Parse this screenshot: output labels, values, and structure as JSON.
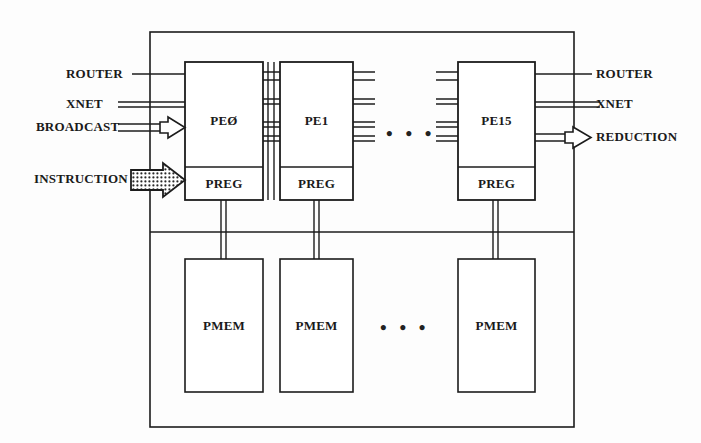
{
  "diagram": {
    "ink_color": "#1c1c1c",
    "background_color": "#fdfdfd",
    "inputs_left": [
      {
        "name": "router-in",
        "label": "ROUTER",
        "style": "single-line",
        "arrow": false
      },
      {
        "name": "xnet-in",
        "label": "XNET",
        "style": "double-line",
        "arrow": false
      },
      {
        "name": "broadcast-in",
        "label": "BROADCAST",
        "style": "double-line",
        "arrow": true
      },
      {
        "name": "instruction-in",
        "label": "INSTRUCTION",
        "style": "hatched-arrow",
        "arrow": true
      }
    ],
    "outputs_right": [
      {
        "name": "router-out",
        "label": "ROUTER",
        "style": "single-line",
        "arrow": false
      },
      {
        "name": "xnet-out",
        "label": "XNET",
        "style": "double-line",
        "arrow": false
      },
      {
        "name": "reduction-out",
        "label": "REDUCTION",
        "style": "double-line",
        "arrow": true
      }
    ],
    "pe_units": [
      {
        "name": "pe-0",
        "label": "PEØ",
        "reg_label": "PREG",
        "mem_label": "PMEM"
      },
      {
        "name": "pe-1",
        "label": "PE1",
        "reg_label": "PREG",
        "mem_label": "PMEM"
      },
      {
        "name": "pe-15",
        "label": "PE15",
        "reg_label": "PREG",
        "mem_label": "PMEM"
      }
    ],
    "ellipsis": {
      "pe_row": "• • •",
      "mem_row": "• • •"
    }
  }
}
